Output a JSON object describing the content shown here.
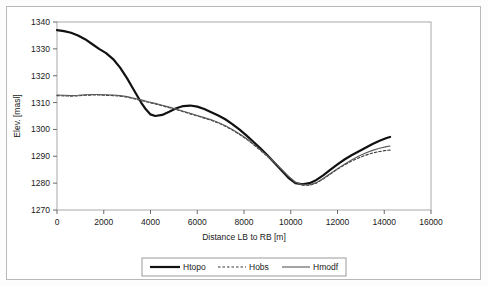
{
  "chart_data": {
    "type": "line",
    "title": "",
    "xlabel": "Distance LB to RB [m]",
    "ylabel": "Elev. [masl]",
    "xlim": [
      0,
      16000
    ],
    "ylim": [
      1270,
      1340
    ],
    "xticks": [
      0,
      2000,
      4000,
      6000,
      8000,
      10000,
      12000,
      14000,
      16000
    ],
    "xtick_labels": [
      "0",
      "2000",
      "4000",
      "6000",
      "8000",
      "10000",
      "12000",
      "14000",
      "16000"
    ],
    "yticks": [
      1270,
      1280,
      1290,
      1300,
      1310,
      1320,
      1330,
      1340
    ],
    "ytick_labels": [
      "1270",
      "1280",
      "1290",
      "1300",
      "1310",
      "1320",
      "1330",
      "1340"
    ],
    "grid": false,
    "legend_position": "bottom",
    "series": [
      {
        "name": "Htopo",
        "style": "solid-thick",
        "color": "#111111",
        "x": [
          0,
          300,
          600,
          900,
          1200,
          1500,
          1800,
          2100,
          2400,
          2700,
          3000,
          3200,
          3400,
          3600,
          3800,
          4000,
          4200,
          4500,
          4800,
          5100,
          5400,
          5700,
          6000,
          6300,
          6600,
          6900,
          7200,
          7500,
          7800,
          8100,
          8400,
          8700,
          9000,
          9300,
          9600,
          9900,
          10200,
          10500,
          10800,
          11100,
          11400,
          11700,
          12000,
          12300,
          12600,
          12900,
          13200,
          13500,
          13800,
          14100,
          14250
        ],
        "y": [
          1337.0,
          1336.6,
          1336.0,
          1335.0,
          1333.6,
          1331.8,
          1330.0,
          1328.4,
          1326.2,
          1323.0,
          1319.0,
          1316.0,
          1313.0,
          1310.0,
          1307.5,
          1305.6,
          1305.0,
          1305.4,
          1306.6,
          1307.9,
          1308.7,
          1308.9,
          1308.5,
          1307.6,
          1306.4,
          1305.2,
          1303.8,
          1302.0,
          1300.0,
          1297.8,
          1295.4,
          1293.0,
          1290.4,
          1287.6,
          1284.8,
          1282.0,
          1280.0,
          1279.6,
          1280.0,
          1281.2,
          1283.0,
          1285.0,
          1287.0,
          1288.8,
          1290.4,
          1291.8,
          1293.2,
          1294.6,
          1295.8,
          1296.8,
          1297.2
        ]
      },
      {
        "name": "Hobs",
        "style": "dashed",
        "color": "#3a3a3a",
        "x": [
          0,
          300,
          600,
          900,
          1200,
          1500,
          1800,
          2100,
          2400,
          2700,
          3000,
          3300,
          3600,
          3900,
          4200,
          4500,
          4800,
          5100,
          5400,
          5700,
          6000,
          6300,
          6600,
          6900,
          7200,
          7500,
          7800,
          8100,
          8400,
          8700,
          9000,
          9300,
          9600,
          9900,
          10200,
          10500,
          10800,
          11100,
          11400,
          11700,
          12000,
          12300,
          12600,
          12900,
          13200,
          13500,
          13800,
          14100,
          14250
        ],
        "y": [
          1312.6,
          1312.5,
          1312.4,
          1312.5,
          1312.7,
          1312.8,
          1312.8,
          1312.7,
          1312.6,
          1312.4,
          1312.0,
          1311.4,
          1310.8,
          1310.1,
          1309.5,
          1308.8,
          1308.1,
          1307.4,
          1306.6,
          1305.8,
          1305.0,
          1304.2,
          1303.4,
          1302.4,
          1301.2,
          1299.8,
          1298.2,
          1296.4,
          1294.4,
          1292.2,
          1290.0,
          1287.6,
          1285.0,
          1282.4,
          1280.2,
          1279.2,
          1279.2,
          1280.0,
          1281.6,
          1283.4,
          1285.2,
          1286.8,
          1288.2,
          1289.4,
          1290.4,
          1291.2,
          1291.8,
          1292.2,
          1292.3
        ]
      },
      {
        "name": "Hmodf",
        "style": "solid-thin",
        "color": "#5a5a5a",
        "x": [
          0,
          300,
          600,
          900,
          1200,
          1500,
          1800,
          2100,
          2400,
          2700,
          3000,
          3300,
          3600,
          3900,
          4200,
          4500,
          4800,
          5100,
          5400,
          5700,
          6000,
          6300,
          6600,
          6900,
          7200,
          7500,
          7800,
          8100,
          8400,
          8700,
          9000,
          9300,
          9600,
          9900,
          10200,
          10500,
          10800,
          11100,
          11400,
          11700,
          12000,
          12300,
          12600,
          12900,
          13200,
          13500,
          13800,
          14100,
          14250
        ],
        "y": [
          1312.8,
          1312.7,
          1312.6,
          1312.7,
          1312.9,
          1313.0,
          1313.0,
          1312.9,
          1312.8,
          1312.6,
          1312.2,
          1311.6,
          1311.0,
          1310.3,
          1309.7,
          1309.0,
          1308.3,
          1307.6,
          1306.8,
          1306.0,
          1305.2,
          1304.4,
          1303.6,
          1302.6,
          1301.4,
          1300.0,
          1298.4,
          1296.6,
          1294.6,
          1292.4,
          1290.2,
          1287.8,
          1285.2,
          1282.6,
          1280.4,
          1279.4,
          1279.4,
          1280.2,
          1281.8,
          1283.6,
          1285.4,
          1287.0,
          1288.6,
          1290.0,
          1291.2,
          1292.2,
          1293.0,
          1293.6,
          1293.8
        ]
      }
    ]
  },
  "legend": {
    "items": [
      {
        "label": "Htopo"
      },
      {
        "label": "Hobs"
      },
      {
        "label": "Hmodf"
      }
    ]
  }
}
